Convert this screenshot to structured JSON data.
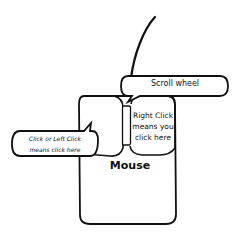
{
  "diagram": {
    "subject": "Mouse",
    "labels": {
      "mouse": "Mouse",
      "scroll_wheel": "Scroll wheel",
      "right_click": "Right Click means you click here",
      "right_click_lines": [
        "Right Click",
        "means you",
        "click here"
      ],
      "left_click": "Click or Left Click means click here",
      "left_click_lines": [
        "Click or Left Click",
        "means click here"
      ]
    },
    "parts": [
      "cord",
      "scroll-wheel",
      "left-button",
      "right-button",
      "mouse-body"
    ],
    "colors": {
      "stroke": "#111111",
      "background": "#ffffff"
    }
  }
}
